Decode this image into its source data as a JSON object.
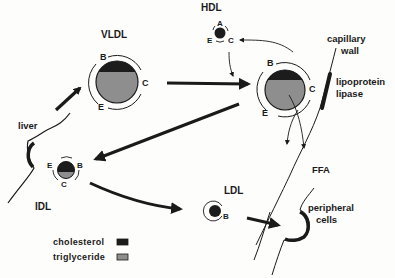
{
  "diagram": {
    "type": "lipoprotein-metabolism-pathway",
    "particles": {
      "vldl": {
        "label": "VLDL",
        "apoproteins": [
          "B",
          "C",
          "E"
        ],
        "composition": "mostly triglyceride, cholesterol cap"
      },
      "hdl": {
        "label": "HDL",
        "apoproteins": [
          "A",
          "E",
          "C"
        ],
        "composition": "cholesterol core"
      },
      "vldl_lipolysis": {
        "apoproteins": [
          "B",
          "C",
          "E"
        ],
        "composition": "mostly triglyceride, cholesterol cap"
      },
      "idl": {
        "label": "IDL",
        "apoproteins": [
          "E",
          "B",
          "C"
        ],
        "composition": "mostly cholesterol, triglyceride base"
      },
      "ldl": {
        "label": "LDL",
        "apoproteins": [
          "B"
        ],
        "composition": "cholesterol core"
      }
    },
    "tissue_labels": {
      "liver": "liver",
      "capillary_wall": [
        "capillary",
        "wall"
      ],
      "lipoprotein_lipase": [
        "lipoprotein",
        "lipase"
      ],
      "ffa": "FFA",
      "peripheral_cells": [
        "peripheral",
        "cells"
      ]
    },
    "legend": {
      "items": [
        {
          "label": "cholesterol",
          "color": "#1c1c1c"
        },
        {
          "label": "triglyceride",
          "color": "#8e8e8e"
        }
      ]
    },
    "colors": {
      "ink": "#1a1a1a",
      "cholesterol": "#1c1c1c",
      "triglyceride": "#8e8e8e",
      "background": "#fdfdfc"
    },
    "flows": [
      "liver -> VLDL",
      "VLDL -> VLDL at capillary (lipoprotein lipase)",
      "VLDL at capillary -> HDL (apo C transfer)",
      "HDL -> VLDL at capillary",
      "VLDL at capillary -> FFA",
      "VLDL at capillary -> IDL",
      "IDL -> liver",
      "IDL -> LDL",
      "LDL -> peripheral cells"
    ]
  }
}
